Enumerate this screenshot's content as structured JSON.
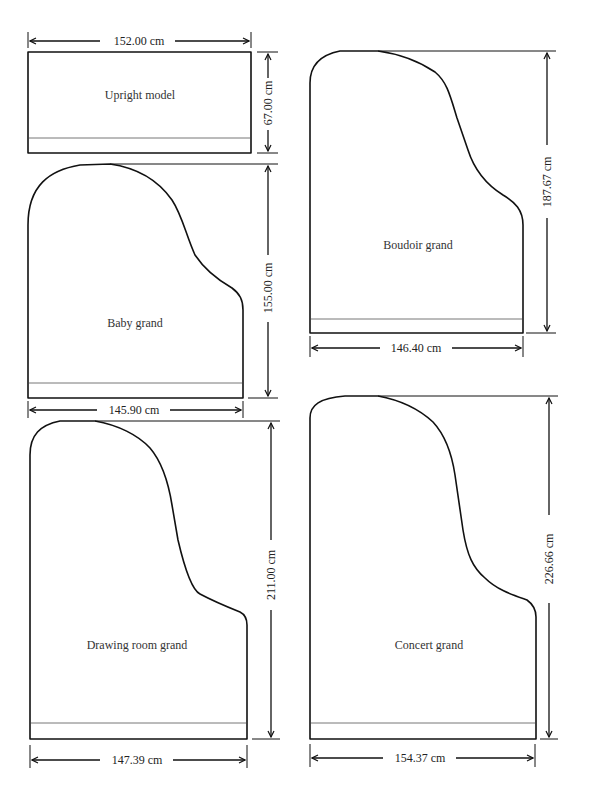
{
  "pianos": [
    {
      "name": "Upright model",
      "width": "152.00 cm",
      "depth": "67.00 cm"
    },
    {
      "name": "Boudoir grand",
      "width": "146.40 cm",
      "depth": "187.67 cm"
    },
    {
      "name": "Baby grand",
      "width": "145.90 cm",
      "depth": "155.00 cm"
    },
    {
      "name": "Drawing room grand",
      "width": "147.39 cm",
      "depth": "211.00 cm"
    },
    {
      "name": "Concert grand",
      "width": "154.37 cm",
      "depth": "226.66 cm"
    }
  ],
  "colors": {
    "outline": "#111111",
    "keyline": "#777777",
    "text": "#333333",
    "background": "#ffffff"
  }
}
